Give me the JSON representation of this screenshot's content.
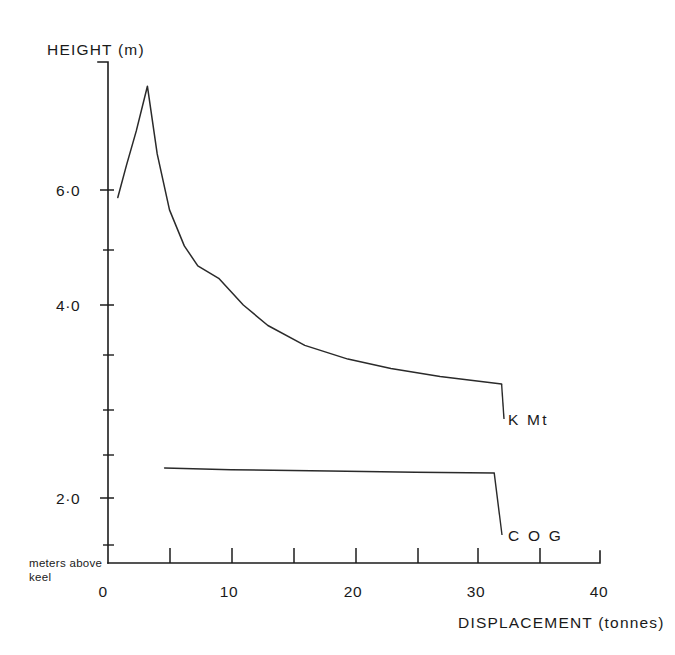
{
  "figure": {
    "background": "#ffffff",
    "ink_color": "#1d1d1d"
  },
  "chart_data": {
    "type": "line",
    "title": "",
    "xlabel": "DISPLACEMENT (tonnes)",
    "ylabel": "HEIGHT (m)",
    "xlim": [
      0,
      40
    ],
    "ylim": [
      0,
      8.0
    ],
    "grid": false,
    "legend_position": "inline-right",
    "x_ticks_major": [
      "0",
      "10",
      "20",
      "30",
      "40"
    ],
    "x_ticks_major_values": [
      0,
      10,
      20,
      30,
      40
    ],
    "x_ticks_minor_values": [
      5,
      15,
      25,
      35
    ],
    "y_ticks_major": [
      "2·0",
      "4·0",
      "6·0"
    ],
    "y_ticks_major_values": [
      2.0,
      4.0,
      6.0
    ],
    "y_ticks_minor_values": [
      1.0,
      3.0,
      5.0,
      7.0
    ],
    "axis_note": "meters above keel",
    "axis_note_line1": "meters above",
    "axis_note_line2": "keel",
    "series": [
      {
        "name": "K Mt",
        "label": "K Mt",
        "points": [
          [
            0.8,
            5.88
          ],
          [
            1.5,
            6.4
          ],
          [
            2.3,
            6.95
          ],
          [
            3.2,
            7.67
          ],
          [
            4.0,
            6.58
          ],
          [
            5.0,
            5.68
          ],
          [
            6.2,
            5.1
          ],
          [
            7.3,
            4.78
          ],
          [
            9.0,
            4.58
          ],
          [
            11.0,
            4.15
          ],
          [
            13.0,
            3.82
          ],
          [
            16.0,
            3.5
          ],
          [
            19.5,
            3.28
          ],
          [
            23.0,
            3.13
          ],
          [
            27.0,
            3.0
          ],
          [
            32.0,
            2.88
          ]
        ]
      },
      {
        "name": "COG",
        "label": "C O G",
        "points": [
          [
            4.6,
            1.53
          ],
          [
            10.0,
            1.5
          ],
          [
            18.0,
            1.48
          ],
          [
            25.0,
            1.46
          ],
          [
            31.4,
            1.45
          ]
        ]
      }
    ]
  }
}
